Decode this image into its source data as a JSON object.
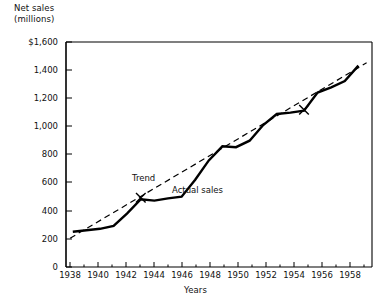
{
  "figure": {
    "background_color": "#ffffff",
    "ink_color": "#000000"
  },
  "chart_data": {
    "type": "line",
    "title": "",
    "ylabel": "Net sales\n(millions)",
    "ylabel_lines": [
      "Net sales",
      "(millions)"
    ],
    "xlabel": "Years",
    "x": [
      1937,
      1938,
      1939,
      1940,
      1941,
      1942,
      1943,
      1944,
      1945,
      1946,
      1947,
      1948,
      1949,
      1950,
      1951,
      1952,
      1953,
      1954,
      1955,
      1956,
      1957,
      1958
    ],
    "xlim": [
      1936.5,
      1959.0
    ],
    "ylim": [
      0,
      1600
    ],
    "grid": false,
    "legend_position": "inline-annotations",
    "ytick_labels": [
      "0",
      "200",
      "400",
      "600",
      "800",
      "1,000",
      "1,200",
      "1,400",
      "$1,600"
    ],
    "ytick_values": [
      0,
      200,
      400,
      600,
      800,
      1000,
      1200,
      1400,
      1600
    ],
    "xtick_labels": [
      "1938",
      "1940",
      "1942",
      "1944",
      "1946",
      "1948",
      "1950",
      "1952",
      "1954",
      "1956",
      "1958"
    ],
    "xtick_values": [
      1938,
      1940,
      1942,
      1944,
      1946,
      1948,
      1950,
      1952,
      1954,
      1956,
      1958
    ],
    "xtick_minor_values": [
      1937,
      1939,
      1941,
      1943,
      1945,
      1947,
      1949,
      1951,
      1953,
      1955,
      1957
    ],
    "series": [
      {
        "name": "Actual sales",
        "style": "solid",
        "color": "#000000",
        "line_width": 2.4,
        "values": [
          250,
          262,
          272,
          292,
          382,
          482,
          472,
          488,
          500,
          620,
          758,
          858,
          852,
          898,
          1010,
          1088,
          1098,
          1112,
          1240,
          1278,
          1322,
          1432
        ]
      },
      {
        "name": "Trend",
        "style": "dashed",
        "color": "#000000",
        "line_width": 1.2,
        "x_endpoints": [
          1936.8,
          1958.6
        ],
        "y_endpoints": [
          205,
          1452
        ]
      }
    ],
    "markers": [
      {
        "label": "x-marker-1942",
        "x": 1942,
        "y": 492,
        "glyph": "×"
      },
      {
        "label": "x-marker-1954",
        "x": 1954,
        "y": 1118,
        "glyph": "×"
      }
    ],
    "annotations": [
      {
        "name": "trend-label",
        "text": "Trend",
        "x": 1942.9,
        "y": 622
      },
      {
        "name": "actual-sales-label",
        "text": "Actual sales",
        "x": 1945.6,
        "y": 540
      }
    ]
  }
}
